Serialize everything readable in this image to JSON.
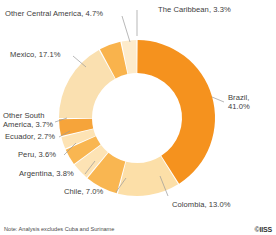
{
  "chart_data": {
    "type": "pie",
    "variant": "donut",
    "title": "",
    "subtitle": "",
    "xlabel": "",
    "ylabel": "",
    "legend_position": "none",
    "labels_position": "outside-with-leader-lines",
    "grid": false,
    "start_angle_deg": 0,
    "direction": "clockwise",
    "units": "%",
    "categories": [
      "Brazil",
      "Colombia",
      "Chile",
      "Argentina",
      "Peru",
      "Ecuador",
      "Other South America",
      "Mexico",
      "Other Central America",
      "The Caribbean"
    ],
    "values": [
      41.0,
      13.0,
      7.0,
      3.8,
      3.6,
      2.7,
      3.7,
      17.1,
      4.7,
      3.3
    ],
    "colors": [
      "#F5921E",
      "#FCDFA8",
      "#F9B651",
      "#FDE3B4",
      "#F9B651",
      "#FDE3B4",
      "#F6A43A",
      "#FAE0B0",
      "#F9B34C",
      "#FDEBCB"
    ],
    "slices": [
      {
        "label": "Brazil",
        "value": 41.0,
        "display": "Brazil, 41.0%",
        "color": "#F5921E"
      },
      {
        "label": "Colombia",
        "value": 13.0,
        "display": "Colombia, 13.0%",
        "color": "#FCDFA8"
      },
      {
        "label": "Chile",
        "value": 7.0,
        "display": "Chile, 7.0%",
        "color": "#F9B651"
      },
      {
        "label": "Argentina",
        "value": 3.8,
        "display": "Argentina, 3.8%",
        "color": "#FDE3B4"
      },
      {
        "label": "Peru",
        "value": 3.6,
        "display": "Peru, 3.6%",
        "color": "#F9B651"
      },
      {
        "label": "Ecuador",
        "value": 2.7,
        "display": "Ecuador, 2.7%",
        "color": "#FDE3B4"
      },
      {
        "label": "Other South America",
        "value": 3.7,
        "display": "Other South America, 3.7%",
        "color": "#F6A43A"
      },
      {
        "label": "Mexico",
        "value": 17.1,
        "display": "Mexico, 17.1%",
        "color": "#FAE0B0"
      },
      {
        "label": "Other Central America",
        "value": 4.7,
        "display": "Other Central America, 4.7%",
        "color": "#F9B34C"
      },
      {
        "label": "The Caribbean",
        "value": 3.3,
        "display": "The Caribbean, 3.3%",
        "color": "#FDEBCB"
      }
    ]
  },
  "labels": {
    "caribbean": "The Caribbean, 3.3%",
    "other_central_america": "Other Central America, 4.7%",
    "mexico": "Mexico, 17.1%",
    "other_south_america_line1": "Other South",
    "other_south_america_line2": "America, 3.7%",
    "ecuador": "Ecuador, 2.7%",
    "peru": "Peru, 3.6%",
    "argentina": "Argentina, 3.8%",
    "chile": "Chile, 7.0%",
    "colombia": "Colombia, 13.0%",
    "brazil_line1": "Brazil,",
    "brazil_line2": "41.0%"
  },
  "footer": {
    "note": "Note: Analysis excludes Cuba and Suriname",
    "credit": "©IISS"
  },
  "style": {
    "background": "#ffffff",
    "label_color": "#3c3c3c",
    "leader_line_color": "#9a9a9a"
  }
}
